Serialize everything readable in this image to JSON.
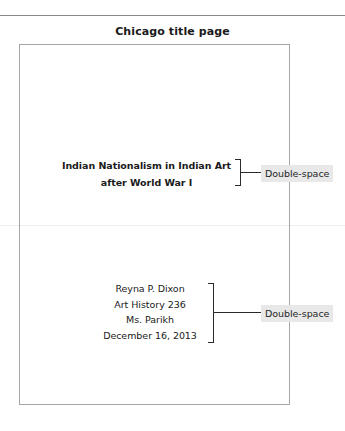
{
  "heading": {
    "text": "Chicago title page"
  },
  "document_page": {
    "title_block": {
      "lines": [
        "Indian Nationalism in Indian Art",
        "after World War I"
      ]
    },
    "info_block": {
      "lines": [
        "Reyna P. Dixon",
        "Art History 236",
        "Ms. Parikh",
        "December 16, 2013"
      ]
    }
  },
  "annotations": [
    {
      "label": "Double-space"
    },
    {
      "label": "Double-space"
    }
  ],
  "colors": {
    "text": "#1a1a1a",
    "rule": "#8a8a8a",
    "page_border": "#a6a6a6",
    "annotation_mark": "#2b2b2b",
    "annotation_label_bg": "#e8e8e8",
    "faint_divider": "#efefef"
  }
}
